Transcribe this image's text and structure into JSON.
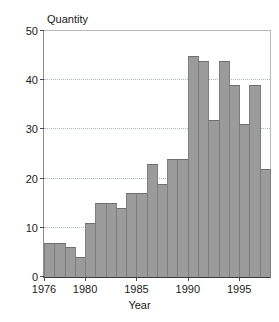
{
  "chart_data": {
    "type": "bar",
    "title": "",
    "xlabel": "Year",
    "ylabel": "Quantity",
    "categories": [
      1976,
      1977,
      1978,
      1979,
      1980,
      1981,
      1982,
      1983,
      1984,
      1985,
      1986,
      1987,
      1988,
      1989,
      1990,
      1991,
      1992,
      1993,
      1994,
      1995,
      1996,
      1997
    ],
    "values": [
      7,
      7,
      6,
      4,
      11,
      15,
      15,
      14,
      17,
      17,
      23,
      19,
      24,
      24,
      45,
      44,
      32,
      44,
      39,
      31,
      39,
      22
    ],
    "xlim": [
      1976,
      1998
    ],
    "ylim": [
      0,
      50
    ],
    "yticks": [
      0,
      10,
      20,
      30,
      40,
      50
    ],
    "ytick_labels": [
      "0",
      "10",
      "20",
      "30",
      "40",
      "50"
    ],
    "xticks": [
      1976,
      1980,
      1985,
      1990,
      1995
    ],
    "xtick_labels": [
      "1976",
      "1980",
      "1985",
      "1990",
      "1995"
    ],
    "gridlines_y": [
      10,
      20,
      30,
      40
    ],
    "grid": "horizontal-dotted",
    "legend": "none",
    "bar_color": "#9b9b9b",
    "bar_edge_color": "#7e7e7e",
    "grid_color": "#a9b6c4",
    "axis_color": "#3a3a3a"
  }
}
